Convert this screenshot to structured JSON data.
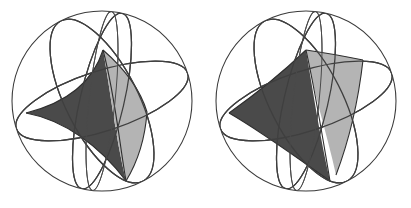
{
  "figure": {
    "title": "Two shaded spherical triangles on great-circle spheres",
    "background_color": "#ffffff",
    "canvas": {
      "width": 411,
      "height": 208
    },
    "panels": [
      {
        "id": "left-panel",
        "name": "concave-spherical-triangle",
        "description": "Sphere with three great circles and a concave (astroid-like) shaded spherical triangle",
        "sphere": {
          "cx": 102,
          "cy": 101,
          "r": 90,
          "stroke_color": "#3a3a3a"
        },
        "triangle_type": "concave",
        "faces": [
          {
            "name": "dark-face",
            "color": "#4a4a4a"
          },
          {
            "name": "light-face",
            "color": "#b4b4b4"
          }
        ],
        "vertices": [
          {
            "name": "top-vertex",
            "x": 103,
            "y": 50
          },
          {
            "name": "left-vertex",
            "x": 26,
            "y": 113
          },
          {
            "name": "bottom-vertex",
            "x": 126,
            "y": 181
          }
        ],
        "great_circle_count": 3
      },
      {
        "id": "right-panel",
        "name": "convex-spherical-triangle",
        "description": "Sphere with three great circles and a convex (geodesic) shaded spherical triangle",
        "sphere": {
          "cx": 306,
          "cy": 101,
          "r": 90,
          "stroke_color": "#3a3a3a"
        },
        "triangle_type": "convex",
        "faces": [
          {
            "name": "dark-face",
            "color": "#4a4a4a"
          },
          {
            "name": "light-face",
            "color": "#b4b4b4"
          }
        ],
        "vertices": [
          {
            "name": "top-vertex",
            "x": 306,
            "y": 50
          },
          {
            "name": "left-vertex",
            "x": 229,
            "y": 113
          },
          {
            "name": "bottom-vertex",
            "x": 330,
            "y": 181
          }
        ],
        "great_circle_count": 3
      }
    ],
    "colors": {
      "dark_gray": "#4a4a4a",
      "light_gray": "#b4b4b4",
      "outline_gray": "#3a3a3a",
      "background": "#ffffff"
    }
  }
}
